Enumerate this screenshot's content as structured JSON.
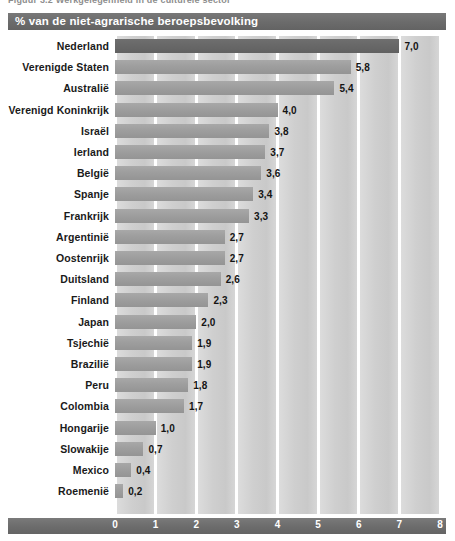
{
  "top_caption": "Figuur 3.2  Werkgelegenheid in de culturele sector",
  "header": {
    "title": "% van de niet-agrarische beroepsbevolking"
  },
  "colors": {
    "header_band": "#6b6b6b",
    "axis_band": "#6c6c6c",
    "bar": "#9e9e9e",
    "bar_highlight": "#686868",
    "band_background": "#cfcfcf",
    "label_text": "#1a1a1a",
    "tick_text": "#ffffff"
  },
  "chart_data": {
    "type": "bar",
    "orientation": "horizontal",
    "title": "% van de niet-agrarische beroepsbevolking",
    "xlabel": "",
    "ylabel": "",
    "xlim": [
      0,
      8
    ],
    "grid": true,
    "legend": null,
    "decimal_separator": ",",
    "highlight_index": 0,
    "xticks": [
      "0",
      "1",
      "2",
      "3",
      "4",
      "5",
      "6",
      "7",
      "8"
    ],
    "categories": [
      "Nederland",
      "Verenigde Staten",
      "Australië",
      "Verenigd Koninkrijk",
      "Israël",
      "Ierland",
      "België",
      "Spanje",
      "Frankrijk",
      "Argentinië",
      "Oostenrijk",
      "Duitsland",
      "Finland",
      "Japan",
      "Tsjechië",
      "Brazilië",
      "Peru",
      "Colombia",
      "Hongarije",
      "Slowakije",
      "Mexico",
      "Roemenië"
    ],
    "values": [
      7.0,
      5.8,
      5.4,
      4.0,
      3.8,
      3.7,
      3.6,
      3.4,
      3.3,
      2.7,
      2.7,
      2.6,
      2.3,
      2.0,
      1.9,
      1.9,
      1.8,
      1.7,
      1.0,
      0.7,
      0.4,
      0.2
    ],
    "value_labels": [
      "7,0",
      "5,8",
      "5,4",
      "4,0",
      "3,8",
      "3,7",
      "3,6",
      "3,4",
      "3,3",
      "2,7",
      "2,7",
      "2,6",
      "2,3",
      "2,0",
      "1,9",
      "1,9",
      "1,8",
      "1,7",
      "1,0",
      "0,7",
      "0,4",
      "0,2"
    ]
  }
}
